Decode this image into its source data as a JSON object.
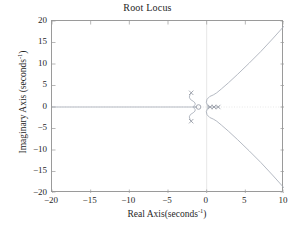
{
  "chart_data": {
    "type": "line",
    "title": "Root Locus",
    "xlabel_main": "Real Axis(seconds",
    "xlabel_sup": "-1",
    "xlabel_close": ")",
    "ylabel_main": "Imaginary Axis (seconds",
    "ylabel_sup": "-1",
    "ylabel_close": ")",
    "xlabel": "Real Axis(seconds^-1)",
    "ylabel": "Imaginary Axis (seconds^-1)",
    "xlim": [
      -20,
      10
    ],
    "ylim": [
      -20,
      20
    ],
    "xticks": [
      "-20",
      "-15",
      "-10",
      "-5",
      "0",
      "5",
      "10"
    ],
    "xtick_values": [
      -20,
      -15,
      -10,
      -5,
      0,
      5,
      10
    ],
    "yticks": [
      "20",
      "15",
      "10",
      "5",
      "0",
      "-5",
      "-10",
      "-15",
      "-20"
    ],
    "ytick_values": [
      20,
      15,
      10,
      5,
      0,
      -5,
      -10,
      -15,
      -20
    ],
    "grid": false,
    "legend": "none",
    "line_color": "#a8adb8",
    "axis_color": "#9a9a9a",
    "zero_axis_color": "#d8d8d8",
    "marker_color": "#8f949f",
    "series": [
      {
        "name": "real-axis-branch",
        "comment": "locus along real axis from -20 to breakaway near -1",
        "x": [
          -20,
          -16,
          -12,
          -8,
          -6,
          -4,
          -3,
          -2.4,
          -2.0,
          -1.8,
          -1.65
        ],
        "y": [
          0,
          0,
          0,
          0,
          0,
          0,
          0,
          0,
          0,
          0,
          0
        ]
      },
      {
        "name": "upper-s-branch",
        "comment": "S shaped branch from pole at (-2,3.3) down to real axis near -1.3",
        "x": [
          -2.0,
          -2.15,
          -2.25,
          -2.1,
          -1.75,
          -1.5,
          -1.5,
          -1.62,
          -1.72,
          -1.7,
          -1.55,
          -1.4
        ],
        "y": [
          3.3,
          2.85,
          2.3,
          1.75,
          1.35,
          0.95,
          0.55,
          0.3,
          0.12,
          0.04,
          0.0,
          0.0
        ]
      },
      {
        "name": "lower-s-branch",
        "comment": "mirror of upper S branch",
        "x": [
          -2.0,
          -2.15,
          -2.25,
          -2.1,
          -1.75,
          -1.5,
          -1.5,
          -1.62,
          -1.72,
          -1.7,
          -1.55,
          -1.4
        ],
        "y": [
          -3.3,
          -2.85,
          -2.3,
          -1.75,
          -1.35,
          -0.95,
          -0.55,
          -0.3,
          -0.12,
          -0.04,
          0.0,
          0.0
        ]
      },
      {
        "name": "upper-asymptote-branch",
        "comment": "branch leaving origin region and rising to (10, 18.8)",
        "x": [
          0.25,
          0.1,
          -0.05,
          0.05,
          0.4,
          0.85,
          1.3,
          1.9,
          2.8,
          4.0,
          5.5,
          7.0,
          8.5,
          10.0
        ],
        "y": [
          0.0,
          0.45,
          1.1,
          1.8,
          2.45,
          2.8,
          3.3,
          4.2,
          5.6,
          7.6,
          10.2,
          12.9,
          15.8,
          18.8
        ]
      },
      {
        "name": "lower-asymptote-branch",
        "comment": "mirror branch falling to (10, -18.8)",
        "x": [
          0.25,
          0.1,
          -0.05,
          0.05,
          0.4,
          0.85,
          1.3,
          1.9,
          2.8,
          4.0,
          5.5,
          7.0,
          8.5,
          10.0
        ],
        "y": [
          0.0,
          -0.45,
          -1.1,
          -1.8,
          -2.45,
          -2.8,
          -3.3,
          -4.2,
          -5.6,
          -7.6,
          -10.2,
          -12.9,
          -15.8,
          -18.8
        ]
      },
      {
        "name": "short-real-segment-right",
        "comment": "short locus segment on real axis right of origin",
        "x": [
          0.1,
          1.6
        ],
        "y": [
          0,
          0
        ]
      }
    ],
    "poles": [
      {
        "label": "pole-upper",
        "x": -2.0,
        "y": 3.3,
        "marker": "x"
      },
      {
        "label": "pole-lower",
        "x": -2.0,
        "y": -3.3,
        "marker": "x"
      },
      {
        "label": "pole-right-a",
        "x": 0.45,
        "y": 0.0,
        "marker": "x"
      },
      {
        "label": "pole-right-b",
        "x": 0.95,
        "y": 0.0,
        "marker": "x"
      },
      {
        "label": "pole-right-c",
        "x": 1.5,
        "y": 0.0,
        "marker": "x"
      }
    ],
    "zeros": [
      {
        "label": "zero-real",
        "x": -1.05,
        "y": 0.0,
        "marker": "o"
      }
    ]
  }
}
